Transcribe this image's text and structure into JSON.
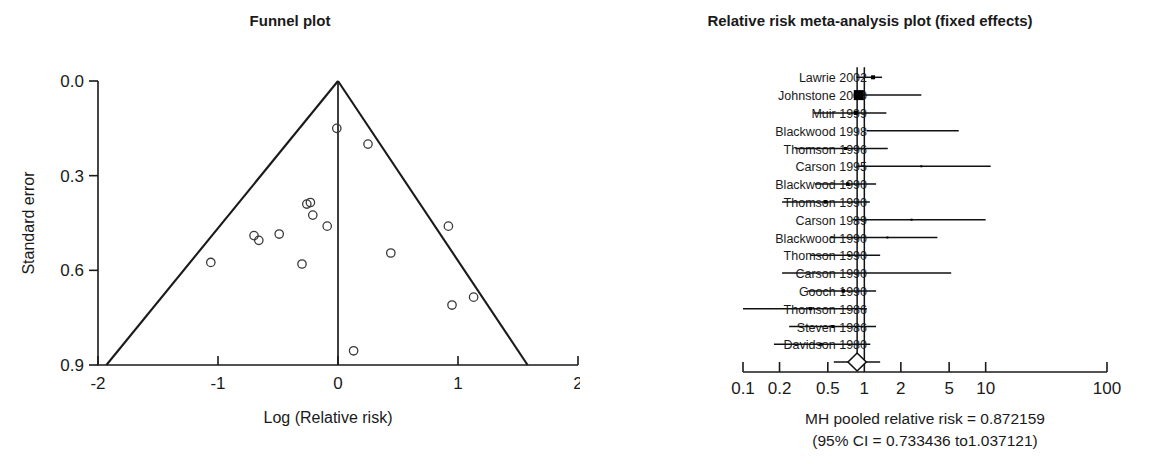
{
  "figure": {
    "panels": [
      {
        "id": "funnel",
        "title": "Funnel plot"
      },
      {
        "id": "forest",
        "title": "Relative risk meta-analysis plot (fixed effects)"
      }
    ]
  },
  "chart_data": [
    {
      "type": "scatter",
      "id": "funnel-plot",
      "title": "Funnel plot",
      "xlabel": "Log (Relative risk)",
      "ylabel": "Standard error",
      "xlim": [
        -2,
        2
      ],
      "ylim": [
        0.9,
        0.0
      ],
      "y_inverted": true,
      "grid": false,
      "legend": "none",
      "xticks": [
        "-2",
        "-1",
        "0",
        "1",
        "2"
      ],
      "xtick_values": [
        -2,
        -1,
        0,
        1,
        2
      ],
      "yticks": [
        "0.0",
        "0.3",
        "0.6",
        "0.9"
      ],
      "ytick_values": [
        0.0,
        0.3,
        0.6,
        0.9
      ],
      "center_line_x": 0,
      "funnel_left_base": [
        -1.93,
        0.9
      ],
      "funnel_right_base": [
        1.58,
        0.9
      ],
      "funnel_apex": [
        0.0,
        0.0
      ],
      "points": [
        {
          "x": -0.01,
          "y": 0.15
        },
        {
          "x": 0.25,
          "y": 0.2
        },
        {
          "x": -0.26,
          "y": 0.39
        },
        {
          "x": -0.23,
          "y": 0.385
        },
        {
          "x": -0.21,
          "y": 0.425
        },
        {
          "x": -0.09,
          "y": 0.46
        },
        {
          "x": -0.7,
          "y": 0.49
        },
        {
          "x": -0.66,
          "y": 0.505
        },
        {
          "x": -0.49,
          "y": 0.485
        },
        {
          "x": 0.92,
          "y": 0.46
        },
        {
          "x": 0.44,
          "y": 0.545
        },
        {
          "x": -1.06,
          "y": 0.575
        },
        {
          "x": -0.3,
          "y": 0.58
        },
        {
          "x": 0.95,
          "y": 0.71
        },
        {
          "x": 1.13,
          "y": 0.685
        },
        {
          "x": 0.13,
          "y": 0.855
        }
      ]
    },
    {
      "type": "forest",
      "id": "forest-plot",
      "title": "Relative risk meta-analysis plot (fixed effects)",
      "xlabel": "",
      "scale": "log10",
      "xlim": [
        0.1,
        100
      ],
      "xticks": [
        "0.1",
        "0.2",
        "0.5",
        "1",
        "2",
        "5",
        "10",
        "100"
      ],
      "xtick_values": [
        0.1,
        0.2,
        0.5,
        1,
        2,
        5,
        10,
        100
      ],
      "reference_line": 1,
      "pooled_line": 0.872159,
      "rows": [
        {
          "label": "Lawrie 2002",
          "rr": 1.18,
          "lo": 0.86,
          "hi": 1.4,
          "weight": 4
        },
        {
          "label": "Johnstone 2000",
          "rr": 0.9,
          "lo": 0.82,
          "hi": 2.95,
          "weight": 10
        },
        {
          "label": "Muir 1999",
          "rr": 0.85,
          "lo": 0.38,
          "hi": 1.52,
          "weight": 4
        },
        {
          "label": "Blackwood 1998",
          "rr": 1.05,
          "lo": 1.05,
          "hi": 6.0,
          "weight": 1
        },
        {
          "label": "Thomson 1996",
          "rr": 0.7,
          "lo": 0.27,
          "hi": 1.56,
          "weight": 3
        },
        {
          "label": "Carson 1995",
          "rr": 2.95,
          "lo": 0.86,
          "hi": 11.0,
          "weight": 2
        },
        {
          "label": "Blackwood 1990",
          "rr": 0.73,
          "lo": 0.39,
          "hi": 1.25,
          "weight": 3.5
        },
        {
          "label": "Thomson 1990",
          "rr": 0.48,
          "lo": 0.21,
          "hi": 1.11,
          "weight": 3.5
        },
        {
          "label": "Carson 1989",
          "rr": 2.45,
          "lo": 0.8,
          "hi": 10.0,
          "weight": 2
        },
        {
          "label": "Blackwood 1990",
          "rr": 1.55,
          "lo": 0.52,
          "hi": 4.0,
          "weight": 2
        },
        {
          "label": "Thomson 1990",
          "rr": 0.75,
          "lo": 0.36,
          "hi": 1.35,
          "weight": 2
        },
        {
          "label": "Carson 1990",
          "rr": 1.0,
          "lo": 0.21,
          "hi": 5.2,
          "weight": 1
        },
        {
          "label": "Gooch 1990",
          "rr": 0.67,
          "lo": 0.34,
          "hi": 1.25,
          "weight": 3.5
        },
        {
          "label": "Thomson 1986",
          "rr": 0.36,
          "lo": 0.1,
          "hi": 1.05,
          "weight": 3
        },
        {
          "label": "Steven 1986",
          "rr": 0.55,
          "lo": 0.24,
          "hi": 1.25,
          "weight": 3
        },
        {
          "label": "Davidson 1980",
          "rr": 0.44,
          "lo": 0.18,
          "hi": 1.12,
          "weight": 3
        }
      ],
      "pooled": {
        "rr": 0.872159,
        "lo": 0.733436,
        "hi": 1.037121,
        "whisker_lo": 0.56,
        "whisker_hi": 1.35
      },
      "footer": [
        "MH pooled relative risk = 0.872159",
        "(95% CI = 0.733436 to1.037121)"
      ]
    }
  ]
}
